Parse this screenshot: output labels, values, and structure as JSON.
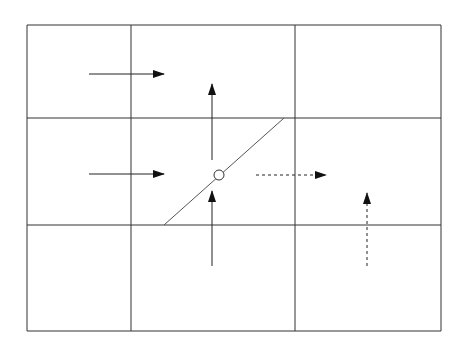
{
  "diagram": {
    "width": 469,
    "height": 349,
    "stroke_color": "#333333",
    "line_color": "#555555",
    "grid": {
      "columns_x": [
        27,
        131,
        295,
        441
      ],
      "rows_y": [
        25,
        118,
        225,
        331
      ]
    },
    "interface": {
      "from": [
        164,
        225
      ],
      "to": [
        284,
        118
      ]
    },
    "marker": {
      "cx": 219,
      "cy": 175,
      "r": 5
    },
    "arrows": [
      {
        "id": "solid-right-top",
        "style": "solid",
        "from": [
          89,
          74
        ],
        "to": [
          164,
          74
        ]
      },
      {
        "id": "solid-right-mid",
        "style": "solid",
        "from": [
          89,
          174
        ],
        "to": [
          164,
          174
        ]
      },
      {
        "id": "solid-up-top",
        "style": "solid",
        "from": [
          212,
          160
        ],
        "to": [
          212,
          84
        ]
      },
      {
        "id": "solid-up-bottom",
        "style": "solid",
        "from": [
          212,
          266
        ],
        "to": [
          212,
          191
        ]
      },
      {
        "id": "dashed-right",
        "style": "dashed",
        "from": [
          256,
          175
        ],
        "to": [
          326,
          175
        ]
      },
      {
        "id": "dashed-up",
        "style": "dashed",
        "from": [
          367,
          266
        ],
        "to": [
          367,
          193
        ]
      }
    ]
  }
}
